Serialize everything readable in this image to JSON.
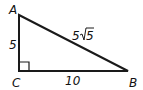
{
  "diagram": {
    "type": "right-triangle",
    "vertices": {
      "A": "A",
      "B": "B",
      "C": "C"
    },
    "sides": {
      "AC": "5",
      "CB": "10",
      "AB_coef": "5",
      "AB_radicand": "5"
    },
    "right_angle_at": "C"
  }
}
